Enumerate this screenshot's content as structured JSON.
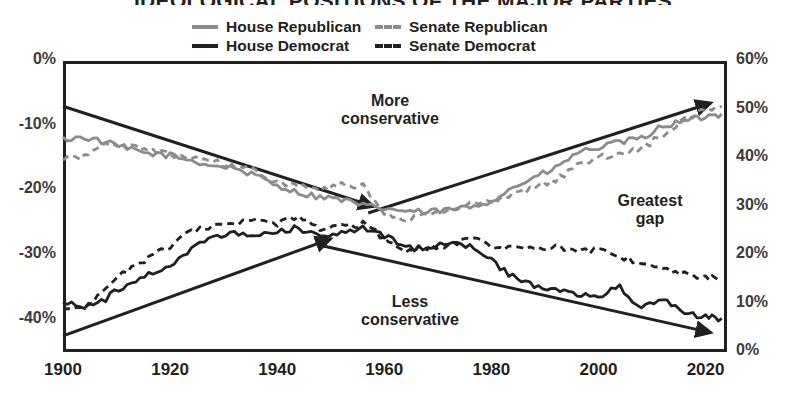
{
  "title": "IDEOLOGICAL POSITIONS OF THE MAJOR PARTIES",
  "legend": {
    "items": [
      {
        "label": "House Republican",
        "style": "solid",
        "color": "#8c8c8c",
        "key": "house_rep"
      },
      {
        "label": "Senate Republican",
        "style": "dashed",
        "color": "#8c8c8c",
        "key": "senate_rep"
      },
      {
        "label": "House Democrat",
        "style": "solid",
        "color": "#231f20",
        "key": "house_dem"
      },
      {
        "label": "Senate Democrat",
        "style": "dashed",
        "color": "#231f20",
        "key": "senate_dem"
      }
    ]
  },
  "annotations": [
    {
      "name": "more-conservative",
      "line1": "More",
      "line2": "conservative"
    },
    {
      "name": "less-conservative",
      "line1": "Less",
      "line2": "conservative"
    },
    {
      "name": "greatest-gap",
      "line1": "Greatest",
      "line2": "gap"
    }
  ],
  "chart_data": {
    "type": "line",
    "title": "IDEOLOGICAL POSITIONS OF THE MAJOR PARTIES",
    "xlabel": "",
    "ylabel": "",
    "grid": false,
    "legend_position": "top",
    "xlim": [
      1900,
      2024
    ],
    "xticks": [
      1900,
      1920,
      1940,
      1960,
      1980,
      2000,
      2020
    ],
    "xticklabels": [
      "1900",
      "1920",
      "1940",
      "1960",
      "1980",
      "2000",
      "2020"
    ],
    "ylim": [
      -45,
      0
    ],
    "yticks": [
      0,
      -10,
      -20,
      -30,
      -40
    ],
    "yticklabels": [
      "0%",
      "-10%",
      "-20%",
      "-30%",
      "-40%"
    ],
    "y2lim": [
      0,
      60
    ],
    "y2ticks": [
      0,
      10,
      20,
      30,
      40,
      50,
      60
    ],
    "y2ticklabels": [
      "0%",
      "10%",
      "20%",
      "30%",
      "40%",
      "50%",
      "60%"
    ],
    "series": [
      {
        "name": "House Republican",
        "color": "#8c8c8c",
        "style": "solid",
        "x": [
          1900,
          1904,
          1908,
          1912,
          1916,
          1920,
          1924,
          1928,
          1932,
          1936,
          1940,
          1944,
          1948,
          1952,
          1956,
          1960,
          1964,
          1968,
          1972,
          1976,
          1980,
          1984,
          1988,
          1992,
          1996,
          2000,
          2004,
          2008,
          2012,
          2016,
          2020,
          2023
        ],
        "y": [
          -12.1,
          -11.8,
          -12.6,
          -13.6,
          -14.3,
          -14.6,
          -15.4,
          -16.2,
          -16.5,
          -17.8,
          -19.2,
          -20.4,
          -21.0,
          -21.4,
          -22.4,
          -22.8,
          -23.2,
          -23.4,
          -23.0,
          -22.6,
          -21.6,
          -19.6,
          -18.0,
          -16.6,
          -14.2,
          -13.4,
          -12.6,
          -12.0,
          -10.0,
          -9.4,
          -8.6,
          -8.2
        ]
      },
      {
        "name": "Senate Republican",
        "color": "#8c8c8c",
        "style": "dashed",
        "x": [
          1900,
          1904,
          1908,
          1912,
          1916,
          1920,
          1924,
          1928,
          1932,
          1936,
          1940,
          1944,
          1948,
          1952,
          1956,
          1960,
          1964,
          1968,
          1972,
          1976,
          1980,
          1984,
          1988,
          1992,
          1996,
          2000,
          2004,
          2008,
          2012,
          2016,
          2020,
          2023
        ],
        "y": [
          -15.0,
          -14.8,
          -12.6,
          -13.2,
          -14.0,
          -14.4,
          -14.8,
          -15.6,
          -16.2,
          -17.0,
          -18.6,
          -19.4,
          -20.2,
          -19.0,
          -19.4,
          -23.8,
          -24.6,
          -23.8,
          -23.0,
          -22.2,
          -21.8,
          -20.8,
          -19.6,
          -18.4,
          -16.2,
          -15.0,
          -14.2,
          -13.6,
          -11.4,
          -9.2,
          -7.6,
          -7.0
        ]
      },
      {
        "name": "House Democrat",
        "color": "#231f20",
        "style": "solid",
        "x": [
          1900,
          1904,
          1908,
          1912,
          1916,
          1920,
          1924,
          1928,
          1932,
          1936,
          1940,
          1944,
          1948,
          1952,
          1956,
          1960,
          1964,
          1968,
          1972,
          1976,
          1980,
          1984,
          1988,
          1992,
          1996,
          2000,
          2004,
          2008,
          2012,
          2016,
          2020,
          2023
        ],
        "y": [
          -37.2,
          -38.0,
          -36.8,
          -34.4,
          -33.0,
          -31.6,
          -29.0,
          -27.4,
          -26.8,
          -26.6,
          -26.4,
          -25.8,
          -27.2,
          -26.4,
          -25.8,
          -27.0,
          -29.0,
          -28.8,
          -28.2,
          -28.6,
          -30.8,
          -33.4,
          -34.6,
          -35.2,
          -36.0,
          -36.4,
          -35.0,
          -38.4,
          -36.6,
          -39.0,
          -39.6,
          -39.8
        ]
      },
      {
        "name": "Senate Democrat",
        "color": "#231f20",
        "style": "dashed",
        "x": [
          1900,
          1904,
          1908,
          1912,
          1916,
          1920,
          1924,
          1928,
          1932,
          1936,
          1940,
          1944,
          1948,
          1952,
          1956,
          1960,
          1964,
          1968,
          1972,
          1976,
          1980,
          1984,
          1988,
          1992,
          1996,
          2000,
          2004,
          2008,
          2012,
          2016,
          2020,
          2023
        ],
        "y": [
          -38.6,
          -38.2,
          -35.4,
          -32.4,
          -30.6,
          -28.6,
          -26.4,
          -25.6,
          -25.2,
          -24.8,
          -25.2,
          -24.2,
          -26.0,
          -25.6,
          -25.2,
          -27.4,
          -29.6,
          -28.8,
          -28.6,
          -27.6,
          -28.4,
          -29.0,
          -29.0,
          -28.6,
          -29.6,
          -29.2,
          -30.4,
          -31.0,
          -32.2,
          -32.8,
          -33.4,
          -33.6
        ]
      }
    ],
    "trend_arrows": [
      {
        "name": "upper-converging-arrow",
        "x1": 1900,
        "y1": -7.0,
        "x2": 1958,
        "y2": -22.5
      },
      {
        "name": "lower-converging-arrow",
        "x1": 1900,
        "y1": -42.5,
        "x2": 1950,
        "y2": -27.5
      },
      {
        "name": "upper-diverging-arrow",
        "x1": 1957,
        "y1": -23.5,
        "x2": 2021,
        "y2": -6.5
      },
      {
        "name": "lower-diverging-arrow",
        "x1": 1948,
        "y1": -28.5,
        "x2": 2021,
        "y2": -42.0
      }
    ]
  }
}
